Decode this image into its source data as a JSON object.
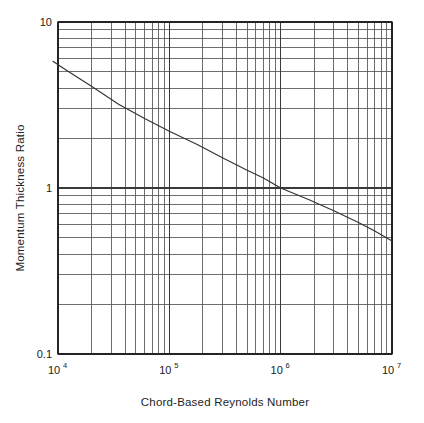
{
  "chart_data": {
    "type": "line",
    "title": "",
    "xlabel": "Chord-Based Reynolds Number",
    "ylabel": "Momentum Thickness Ratio",
    "xscale": "log",
    "yscale": "log",
    "xlim": [
      10000,
      10000000
    ],
    "ylim": [
      0.1,
      10
    ],
    "grid": "both-major-and-minor",
    "legend": "none",
    "x_tick_labels": [
      "10⁴",
      "10⁵",
      "10⁶",
      "10⁷"
    ],
    "x_tick_mantissa": [
      "10",
      "10",
      "10",
      "10"
    ],
    "x_tick_exponent": [
      "4",
      "5",
      "6",
      "7"
    ],
    "x_tick_values": [
      10000,
      100000,
      1000000,
      10000000
    ],
    "y_tick_labels": [
      "10",
      "1",
      "0.1"
    ],
    "y_tick_values": [
      10,
      1,
      0.1
    ],
    "series": [
      {
        "name": "Momentum Thickness Ratio",
        "color": "#333333",
        "x": [
          9000,
          12000,
          20000,
          35000,
          60000,
          100000,
          180000,
          300000,
          500000,
          700000,
          1000000,
          1800000,
          3000000,
          5000000,
          7000000,
          10000000
        ],
        "y": [
          5.8,
          5.1,
          4.1,
          3.2,
          2.62,
          2.2,
          1.82,
          1.52,
          1.28,
          1.15,
          1.0,
          0.85,
          0.73,
          0.62,
          0.55,
          0.48
        ]
      }
    ]
  },
  "figure": {
    "background_color": "#ffffff",
    "axis_color": "#1a1a1a",
    "major_grid_color": "#3a3a3a",
    "minor_grid_color": "#555555",
    "curve_color": "#333333"
  }
}
